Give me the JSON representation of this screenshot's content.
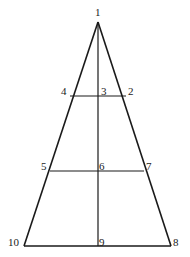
{
  "diagram": {
    "type": "triangle-with-crosslines",
    "stroke_color": "#1a1a1a",
    "points": [
      {
        "id": "1",
        "label": "1",
        "x": 98,
        "y": 22,
        "lx": 95,
        "ly": 15
      },
      {
        "id": "2",
        "label": "2",
        "x": 125,
        "y": 96,
        "lx": 128,
        "ly": 95
      },
      {
        "id": "3",
        "label": "3",
        "x": 98,
        "y": 96,
        "lx": 101,
        "ly": 95
      },
      {
        "id": "4",
        "label": "4",
        "x": 72,
        "y": 96,
        "lx": 61,
        "ly": 95
      },
      {
        "id": "5",
        "label": "5",
        "x": 50,
        "y": 171,
        "lx": 41,
        "ly": 170
      },
      {
        "id": "6",
        "label": "6",
        "x": 98,
        "y": 171,
        "lx": 99,
        "ly": 170
      },
      {
        "id": "7",
        "label": "7",
        "x": 144,
        "y": 171,
        "lx": 146,
        "ly": 170
      },
      {
        "id": "8",
        "label": "8",
        "x": 171,
        "y": 246,
        "lx": 173,
        "ly": 246
      },
      {
        "id": "9",
        "label": "9",
        "x": 98,
        "y": 246,
        "lx": 99,
        "ly": 246
      },
      {
        "id": "10",
        "label": "10",
        "x": 24,
        "y": 246,
        "lx": 9,
        "ly": 246
      }
    ],
    "labels": {
      "p1": "1",
      "p2": "2",
      "p3": "3",
      "p4": "4",
      "p5": "5",
      "p6": "6",
      "p7": "7",
      "p8": "8",
      "p9": "9",
      "p10": "10"
    }
  }
}
